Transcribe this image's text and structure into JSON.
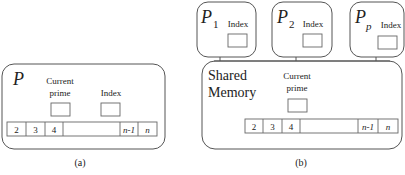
{
  "panel_a": {
    "caption": "(a)",
    "process_label": "P",
    "current_prime_label_line1": "Current",
    "current_prime_label_line2": "prime",
    "index_label": "Index",
    "array_cells": [
      "2",
      "3",
      "4",
      "",
      "n-1",
      "n"
    ]
  },
  "panel_b": {
    "caption": "(b)",
    "processors": [
      {
        "label": "P",
        "subscript": "1",
        "index_label": "Index"
      },
      {
        "label": "P",
        "subscript": "2",
        "index_label": "Index"
      },
      {
        "label": "P",
        "subscript": "p",
        "index_label": "Index"
      }
    ],
    "shared_memory_line1": "Shared",
    "shared_memory_line2": "Memory",
    "current_prime_label_line1": "Current",
    "current_prime_label_line2": "prime",
    "array_cells": [
      "2",
      "3",
      "4",
      "",
      "n-1",
      "n"
    ]
  },
  "colors": {
    "stroke": "#555555",
    "text": "#222222",
    "background": "#ffffff"
  }
}
